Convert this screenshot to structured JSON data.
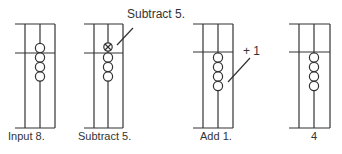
{
  "diagram": {
    "steps": [
      {
        "label": "Input 8.",
        "beads_below": 4,
        "beads_above": 1,
        "top_bead_crossed": false
      },
      {
        "label": "Subtract 5.",
        "beads_below": 3,
        "beads_above": 1,
        "top_bead_crossed": true
      },
      {
        "label": "Add 1.",
        "beads_below": 4,
        "beads_above": 0,
        "top_bead_crossed": false
      },
      {
        "label": "4",
        "beads_below": 4,
        "beads_above": 0,
        "top_bead_crossed": false
      }
    ],
    "annotations": {
      "subtract_callout": "Subtract 5.",
      "add_callout": "+ 1"
    },
    "colors": {
      "line": "#333333",
      "background": "#ffffff"
    }
  }
}
